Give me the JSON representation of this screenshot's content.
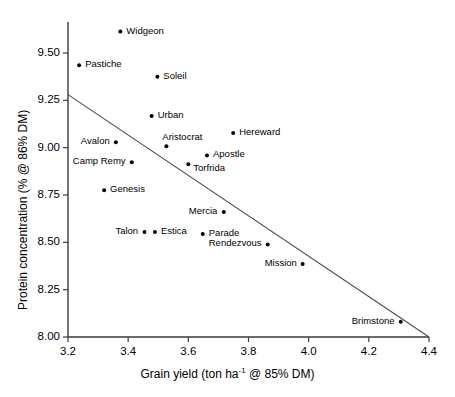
{
  "chart_data": {
    "type": "scatter",
    "title": "",
    "xlabel": "Grain yield (ton ha-1 @ 85% DM)",
    "xlabel_prefix": "Grain yield (ton ha",
    "xlabel_sup": "-1",
    "xlabel_suffix": " @ 85% DM)",
    "ylabel": "Protein concentration (% @ 86% DM)",
    "xlim": [
      3.2,
      4.4
    ],
    "ylim": [
      8.0,
      9.65
    ],
    "xticks": [
      "3.2",
      "3.4",
      "3.6",
      "3.8",
      "4.0",
      "4.2",
      "4.4"
    ],
    "xtick_values": [
      3.2,
      3.4,
      3.6,
      3.8,
      4.0,
      4.2,
      4.4
    ],
    "yticks": [
      "8.00",
      "8.25",
      "8.50",
      "8.75",
      "9.00",
      "9.25",
      "9.50"
    ],
    "ytick_values": [
      8.0,
      8.25,
      8.5,
      8.75,
      9.0,
      9.25,
      9.5
    ],
    "grid": false,
    "legend": false,
    "marker_color": "#000000",
    "line_color": "#4a4a4a",
    "axis_color": "#3a3a3a",
    "trend_line": {
      "x": [
        3.2,
        4.4
      ],
      "y": [
        9.28,
        8.0
      ]
    },
    "points": [
      {
        "label": "Widgeon",
        "x": 3.374,
        "y": 9.613,
        "label_side": "right"
      },
      {
        "label": "Pastiche",
        "x": 3.237,
        "y": 9.435,
        "label_side": "right"
      },
      {
        "label": "Soleil",
        "x": 3.497,
        "y": 9.374,
        "label_side": "right"
      },
      {
        "label": "Urban",
        "x": 3.478,
        "y": 9.167,
        "label_side": "right"
      },
      {
        "label": "Hereward",
        "x": 3.749,
        "y": 9.077,
        "label_side": "right"
      },
      {
        "label": "Avalon",
        "x": 3.359,
        "y": 9.029,
        "label_side": "left"
      },
      {
        "label": "Aristocrat",
        "x": 3.527,
        "y": 9.008,
        "label_side": "above"
      },
      {
        "label": "Apostle",
        "x": 3.662,
        "y": 8.959,
        "label_side": "right"
      },
      {
        "label": "Camp Remy",
        "x": 3.412,
        "y": 8.923,
        "label_side": "left"
      },
      {
        "label": "Torfrida",
        "x": 3.6,
        "y": 8.912,
        "label_side": "right-below"
      },
      {
        "label": "Genesis",
        "x": 3.32,
        "y": 8.775,
        "label_side": "right"
      },
      {
        "label": "Mercia",
        "x": 3.718,
        "y": 8.66,
        "label_side": "left"
      },
      {
        "label": "Talon",
        "x": 3.454,
        "y": 8.555,
        "label_side": "left"
      },
      {
        "label": "Estica",
        "x": 3.489,
        "y": 8.555,
        "label_side": "right"
      },
      {
        "label": "Parade",
        "x": 3.648,
        "y": 8.544,
        "label_side": "right"
      },
      {
        "label": "Rendezvous",
        "x": 3.864,
        "y": 8.489,
        "label_side": "left"
      },
      {
        "label": "Mission",
        "x": 3.98,
        "y": 8.385,
        "label_side": "left"
      },
      {
        "label": "Brimstone",
        "x": 4.306,
        "y": 8.08,
        "label_side": "left"
      }
    ]
  }
}
